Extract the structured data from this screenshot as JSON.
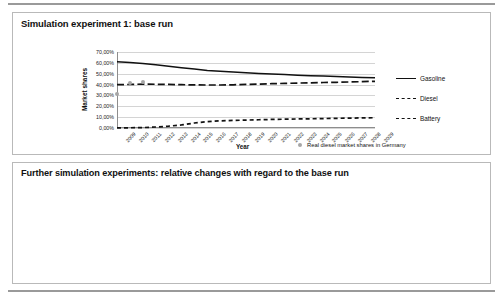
{
  "page": {
    "panel1_title": "Simulation experiment 1: base run",
    "panel2_title": "Further simulation experiments: relative changes with regard to the base run"
  },
  "chart_data": [
    {
      "type": "line",
      "title": "Simulation experiment 1: base run",
      "xlabel": "Year",
      "ylabel": "Market shares",
      "ylim": [
        0,
        70
      ],
      "ytick_labels": [
        "0,00%",
        "10,00%",
        "20,00%",
        "30,00%",
        "40,00%",
        "50,00%",
        "60,00%",
        "70,00%"
      ],
      "ytick_values": [
        0,
        10,
        20,
        30,
        40,
        50,
        60,
        70
      ],
      "grid": true,
      "legend_position": "right",
      "categories": [
        "2009",
        "2010",
        "2011",
        "2012",
        "2013",
        "2014",
        "2015",
        "2016",
        "2017",
        "2018",
        "2019",
        "2020",
        "2021",
        "2022",
        "2023",
        "2024",
        "2025",
        "2026",
        "2027",
        "2028",
        "2029"
      ],
      "series": [
        {
          "name": "Gasoline",
          "style": "solid",
          "values": [
            61.0,
            60.3,
            59.4,
            58.2,
            56.9,
            55.6,
            54.3,
            53.0,
            52.2,
            51.6,
            51.0,
            50.3,
            49.7,
            49.2,
            48.7,
            48.2,
            47.8,
            47.4,
            47.0,
            46.6,
            46.2
          ]
        },
        {
          "name": "Diesel",
          "style": "long-dash",
          "values": [
            39.9,
            40.1,
            40.4,
            40.3,
            40.1,
            39.9,
            39.7,
            39.6,
            39.6,
            39.8,
            40.1,
            40.4,
            40.8,
            41.1,
            41.4,
            41.6,
            41.9,
            42.1,
            42.4,
            42.7,
            43.0
          ]
        },
        {
          "name": "Battery",
          "style": "short-dash",
          "values": [
            0.1,
            0.2,
            0.4,
            0.9,
            1.7,
            2.8,
            4.6,
            5.9,
            6.6,
            7.0,
            7.3,
            7.6,
            7.9,
            8.1,
            8.3,
            8.5,
            8.7,
            8.9,
            9.1,
            9.3,
            9.5
          ]
        }
      ],
      "scatter_series": {
        "name": "Real diesel market shares in Germany",
        "marker": "gray-dot",
        "points": [
          {
            "x": "2009",
            "y": 31.0
          },
          {
            "x": "2010",
            "y": 41.4
          },
          {
            "x": "2011",
            "y": 42.6
          }
        ]
      }
    },
    {
      "type": "bar",
      "title": "Further simulation experiments: relative changes with regard to the base run",
      "xlabel": "",
      "ylabel": "Relative changes market shares",
      "ylim": [
        0,
        50
      ],
      "ytick_labels": [
        "0,0%",
        "10,0%",
        "20,0%",
        "30,0%",
        "40,0%",
        "50,0%"
      ],
      "ytick_values": [
        0,
        10,
        20,
        30,
        40,
        50
      ],
      "grid": true,
      "legend_position": "bottom",
      "categories": [
        "Battery electric vehicles 2020",
        "Battery electric vehicles 2025",
        "Battery electric vehicles 2029"
      ],
      "series": [
        {
          "name": "Portfolio definition",
          "fill": "black",
          "values": [
            4.8,
            1.4,
            0.4
          ]
        },
        {
          "name": "Scenario definition",
          "fill": "gray",
          "values": [
            18.8,
            29.7,
            44.2
          ]
        },
        {
          "name": "Market definition",
          "fill": "white",
          "values": [
            39.9,
            42.6,
            36.8
          ]
        }
      ]
    }
  ]
}
